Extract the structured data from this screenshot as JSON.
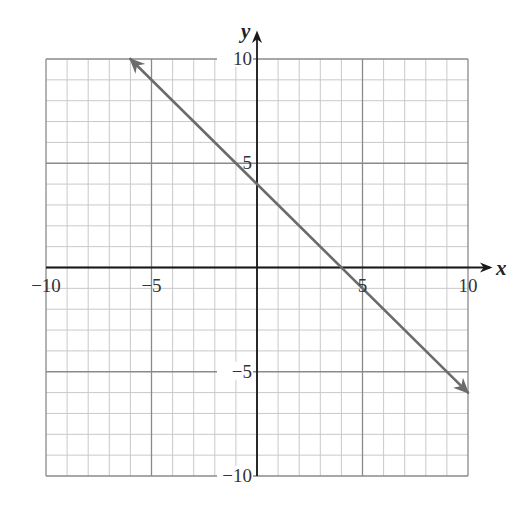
{
  "chart_data": {
    "type": "line",
    "title": "",
    "xlabel": "x",
    "ylabel": "y",
    "xlim": [
      -10,
      10
    ],
    "ylim": [
      -10,
      10
    ],
    "grid": true,
    "grid_minor_step": 1,
    "grid_major_step": 5,
    "x_ticks": [
      {
        "value": -10,
        "label": "−10"
      },
      {
        "value": -5,
        "label": "−5"
      },
      {
        "value": 5,
        "label": "5"
      },
      {
        "value": 10,
        "label": "10"
      }
    ],
    "y_ticks": [
      {
        "value": 10,
        "label": "10"
      },
      {
        "value": 5,
        "label": "5"
      },
      {
        "value": -5,
        "label": "−5"
      },
      {
        "value": -10,
        "label": "−10"
      }
    ],
    "series": [
      {
        "name": "line",
        "equation": "y = -x + 4",
        "slope": -1,
        "intercept": 4,
        "x": [
          -6,
          0,
          4,
          10
        ],
        "y": [
          10,
          4,
          0,
          -6
        ],
        "arrows": "both",
        "color": "#6b6b6b"
      }
    ]
  },
  "colors": {
    "minor_grid": "#c9c9c9",
    "major_grid": "#8a8a8a",
    "axis": "#1a1a1a",
    "line": "#6b6b6b"
  }
}
